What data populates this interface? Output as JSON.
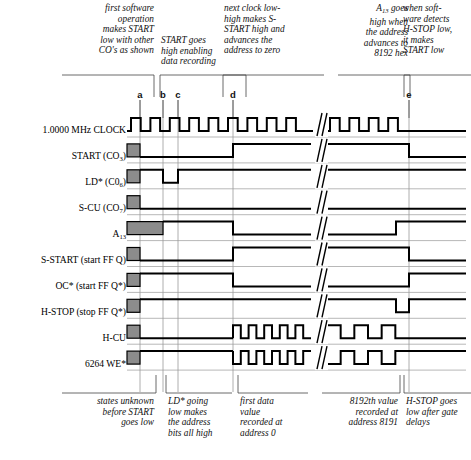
{
  "colors": {
    "ink": "#000000",
    "unknown_fill": "#8c8c8c",
    "guide": "#9a9a9a",
    "background": "#ffffff"
  },
  "top_notes": [
    {
      "id": "note-a",
      "align": "right",
      "lines": [
        "first software",
        "operation",
        "makes START",
        "low with other",
        "CO's as shown"
      ]
    },
    {
      "id": "note-bd",
      "align": "left",
      "lines": [
        "START goes",
        "high enabling",
        "data recording"
      ]
    },
    {
      "id": "note-d",
      "align": "left",
      "lines": [
        "next clock low-",
        "high makes S-",
        "START high and",
        "advances the",
        "address to zero"
      ]
    },
    {
      "id": "note-a13",
      "align": "right",
      "lines": [
        "A",
        "goes",
        "high when",
        "the address",
        "advances to",
        "8192 hex"
      ],
      "subscript": "13"
    },
    {
      "id": "note-e",
      "align": "left",
      "lines": [
        "when soft-",
        "ware detects",
        "H-STOP low,",
        "it makes",
        "START low"
      ]
    }
  ],
  "markers": [
    {
      "label": "a",
      "x": 140
    },
    {
      "label": "b",
      "x": 163
    },
    {
      "label": "c",
      "x": 178
    },
    {
      "label": "d",
      "x": 233
    },
    {
      "label": "e",
      "x": 409
    }
  ],
  "signals": [
    {
      "name": "1.0000 MHz CLOCK",
      "bold_part": "CLOCK",
      "row": 0
    },
    {
      "name": "START (CO3)",
      "base": "START (CO",
      "sub": "3",
      "tail": ")",
      "row": 1
    },
    {
      "name": "LD* (C06)",
      "base": "LD* (C0",
      "sub": "6",
      "tail": ")",
      "row": 2
    },
    {
      "name": "S-CU (CO7)",
      "base": "S-CU (CO",
      "sub": "7",
      "tail": ")",
      "row": 3
    },
    {
      "name": "A13",
      "base": "A",
      "sub": "13",
      "tail": "",
      "row": 4
    },
    {
      "name": "S-START (start FF Q)",
      "base": "S-START (start FF Q)",
      "sub": "",
      "tail": "",
      "row": 5
    },
    {
      "name": "OC* (start FF Q*)",
      "base": "OC* (start FF Q*)",
      "sub": "",
      "tail": "",
      "row": 6
    },
    {
      "name": "H-STOP (stop FF Q*)",
      "base": "H-STOP (stop FF Q*)",
      "sub": "",
      "tail": "",
      "row": 7
    },
    {
      "name": "H-CU",
      "base": "H-CU",
      "sub": "",
      "tail": "",
      "row": 8
    },
    {
      "name": "6264 WE*",
      "base": "6264 WE*",
      "sub": "",
      "tail": "",
      "row": 9
    }
  ],
  "bottom_captions": [
    {
      "id": "cap-a",
      "align": "right",
      "lines": [
        "states unknown",
        "before START",
        "goes low"
      ]
    },
    {
      "id": "cap-c",
      "align": "left",
      "lines": [
        "LD* going",
        "low makes",
        "the address",
        "bits all high"
      ]
    },
    {
      "id": "cap-d",
      "align": "left",
      "lines": [
        "first data",
        "value",
        "recorded at",
        "address 0"
      ]
    },
    {
      "id": "cap-8192",
      "align": "right",
      "lines": [
        "8192th value",
        "recorded at",
        "address 8191"
      ]
    },
    {
      "id": "cap-e",
      "align": "left",
      "lines": [
        "H-STOP goes",
        "low after gate",
        "delays"
      ]
    }
  ],
  "chart_data": {
    "type": "timing-diagram",
    "xlabel": "time",
    "ylabel": "signal",
    "clock_frequency": "1.0000 MHz",
    "break_symbol": "//",
    "break_x": 320,
    "axis_x_start": 127,
    "axis_x_end": 466,
    "unknown_region_end": 140,
    "row_pitch": 25.9,
    "row0_y": 131,
    "marker_x": {
      "a": 140,
      "b": 163,
      "c": 178,
      "d": 233,
      "e": 409
    },
    "traces": [
      {
        "name": "1.0000 MHz CLOCK",
        "kind": "clock",
        "pulses_before_break": 10,
        "pulses_after_break": 4,
        "period": 19.4,
        "duty": 0.5
      },
      {
        "name": "START (CO3)",
        "kind": "level",
        "segments": [
          {
            "from": 127,
            "to": 140,
            "level": "unknown"
          },
          {
            "from": 140,
            "to": 233,
            "level": "low"
          },
          {
            "from": 233,
            "to": 409,
            "level": "high"
          },
          {
            "from": 409,
            "to": 466,
            "level": "low"
          }
        ]
      },
      {
        "name": "LD* (C06)",
        "kind": "level",
        "segments": [
          {
            "from": 127,
            "to": 140,
            "level": "unknown"
          },
          {
            "from": 140,
            "to": 163,
            "level": "high"
          },
          {
            "from": 163,
            "to": 178,
            "level": "low"
          },
          {
            "from": 178,
            "to": 466,
            "level": "high"
          }
        ]
      },
      {
        "name": "S-CU (CO7)",
        "kind": "level",
        "segments": [
          {
            "from": 127,
            "to": 140,
            "level": "unknown"
          },
          {
            "from": 140,
            "to": 466,
            "level": "low"
          }
        ]
      },
      {
        "name": "A13",
        "kind": "level",
        "segments": [
          {
            "from": 127,
            "to": 163,
            "level": "unknown"
          },
          {
            "from": 163,
            "to": 233,
            "level": "high"
          },
          {
            "from": 233,
            "to": 396,
            "level": "low"
          },
          {
            "from": 396,
            "to": 466,
            "level": "high"
          }
        ]
      },
      {
        "name": "S-START (start FF Q)",
        "kind": "level",
        "segments": [
          {
            "from": 127,
            "to": 140,
            "level": "unknown"
          },
          {
            "from": 140,
            "to": 233,
            "level": "low"
          },
          {
            "from": 233,
            "to": 409,
            "level": "high"
          },
          {
            "from": 409,
            "to": 466,
            "level": "low"
          }
        ]
      },
      {
        "name": "OC* (start FF Q*)",
        "kind": "level",
        "segments": [
          {
            "from": 127,
            "to": 140,
            "level": "unknown"
          },
          {
            "from": 140,
            "to": 233,
            "level": "high"
          },
          {
            "from": 233,
            "to": 409,
            "level": "low"
          },
          {
            "from": 409,
            "to": 466,
            "level": "high"
          }
        ]
      },
      {
        "name": "H-STOP (stop FF Q*)",
        "kind": "level",
        "segments": [
          {
            "from": 127,
            "to": 140,
            "level": "unknown"
          },
          {
            "from": 140,
            "to": 396,
            "level": "high"
          },
          {
            "from": 396,
            "to": 409,
            "level": "low"
          },
          {
            "from": 409,
            "to": 466,
            "level": "high"
          }
        ]
      },
      {
        "name": "H-CU",
        "kind": "burst",
        "idle_level": "low",
        "burst_from": 233,
        "burst_to": 409,
        "pulses_before_break": 5,
        "pulses_after_break": 3,
        "unknown_to": 140
      },
      {
        "name": "6264 WE*",
        "kind": "burst",
        "idle_level": "high",
        "burst_from": 233,
        "burst_to": 409,
        "pulses_before_break": 5,
        "pulses_after_break": 3,
        "unknown_to": 140,
        "inverted": true
      }
    ]
  }
}
